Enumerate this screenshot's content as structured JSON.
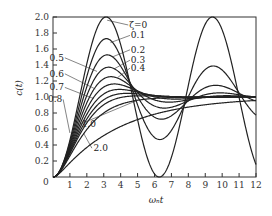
{
  "chart_data": {
    "type": "line",
    "title": "",
    "xlabel": "ωₙt",
    "ylabel": "c(t)",
    "xlim": [
      0,
      12
    ],
    "ylim": [
      0,
      2.0
    ],
    "grid": false,
    "legend_position": "inline annotations",
    "x_ticks": [
      "0",
      "1",
      "2",
      "3",
      "4",
      "5",
      "6",
      "7",
      "8",
      "9",
      "10",
      "11",
      "12"
    ],
    "y_ticks": [
      "0.2",
      "0.4",
      "0.6",
      "0.8",
      "1.0",
      "1.2",
      "1.4",
      "1.6",
      "1.8",
      "2.0"
    ],
    "series": [
      {
        "name": "ζ=0",
        "zeta": 0.0,
        "peak": 2.0,
        "peak_time": 3.14
      },
      {
        "name": "0.1",
        "zeta": 0.1,
        "peak": 1.73,
        "peak_time": 3.16
      },
      {
        "name": "0.2",
        "zeta": 0.2,
        "peak": 1.53,
        "peak_time": 3.21
      },
      {
        "name": "0.3",
        "zeta": 0.3,
        "peak": 1.37,
        "peak_time": 3.29
      },
      {
        "name": "0.4",
        "zeta": 0.4,
        "peak": 1.25,
        "peak_time": 3.43
      },
      {
        "name": "0.5",
        "zeta": 0.5,
        "peak": 1.16,
        "peak_time": 3.63
      },
      {
        "name": "0.6",
        "zeta": 0.6,
        "peak": 1.09,
        "peak_time": 3.93
      },
      {
        "name": "0.7",
        "zeta": 0.7,
        "peak": 1.05,
        "peak_time": 4.4
      },
      {
        "name": "0.8",
        "zeta": 0.8,
        "peak": 1.02,
        "peak_time": 5.24
      },
      {
        "name": "1.0",
        "zeta": 1.0,
        "peak": 1.0,
        "peak_time": null
      },
      {
        "name": "2.0",
        "zeta": 2.0,
        "peak": 1.0,
        "peak_time": null
      }
    ],
    "annotations": [
      {
        "text": "ζ=0",
        "x": 4.5,
        "y": 1.9
      },
      {
        "text": "0.1",
        "x": 4.6,
        "y": 1.77
      },
      {
        "text": "0.2",
        "x": 4.6,
        "y": 1.59
      },
      {
        "text": "0.3",
        "x": 4.6,
        "y": 1.46
      },
      {
        "text": "0.4",
        "x": 4.6,
        "y": 1.36
      },
      {
        "text": "0.5",
        "x": -0.2,
        "y": 1.49
      },
      {
        "text": "0.6",
        "x": -0.2,
        "y": 1.29
      },
      {
        "text": "0.7",
        "x": -0.2,
        "y": 1.12
      },
      {
        "text": "0.8",
        "x": -0.3,
        "y": 0.97
      },
      {
        "text": "1.0",
        "x": 1.7,
        "y": 0.66
      },
      {
        "text": "2.0",
        "x": 2.4,
        "y": 0.36
      }
    ]
  }
}
